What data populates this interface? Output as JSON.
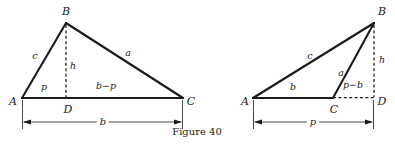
{
  "figure": {
    "caption": "Figure 40",
    "background_color": "#ffffff",
    "ink_color": "#1a1a1a",
    "solid_stroke_width": 2.1,
    "thin_stroke_width": 0.8,
    "dash_pattern": "3,2.4"
  },
  "diagrams": [
    {
      "id": "acute-triangle",
      "name": "acute triangle with interior altitude",
      "vertices": {
        "A": {
          "label": "A",
          "x": 22,
          "y": 98
        },
        "B": {
          "label": "B",
          "x": 66,
          "y": 23
        },
        "C": {
          "label": "C",
          "x": 183,
          "y": 98
        },
        "D": {
          "label": "D",
          "x": 66,
          "y": 98
        }
      },
      "vertex_labels": [
        {
          "text": "A",
          "x": 13,
          "y": 101
        },
        {
          "text": "B",
          "x": 66,
          "y": 11
        },
        {
          "text": "C",
          "x": 191,
          "y": 101
        },
        {
          "text": "D",
          "x": 68,
          "y": 109
        }
      ],
      "solid_edges": [
        {
          "name": "side-c",
          "from": "A",
          "to": "B"
        },
        {
          "name": "side-a",
          "from": "B",
          "to": "C"
        },
        {
          "name": "base-b",
          "from": "A",
          "to": "C"
        }
      ],
      "dashed_edges": [
        {
          "name": "altitude-h",
          "from": "B",
          "to": "D"
        }
      ],
      "side_labels": [
        {
          "name": "label-c",
          "text": "c",
          "x": 35,
          "y": 56
        },
        {
          "name": "label-a",
          "text": "a",
          "x": 128,
          "y": 53
        },
        {
          "name": "label-h",
          "text": "h",
          "x": 73,
          "y": 66
        },
        {
          "name": "label-p",
          "text": "p",
          "x": 44,
          "y": 87
        },
        {
          "name": "label-b-minus-p",
          "text": "b−p",
          "x": 106,
          "y": 86
        }
      ],
      "dimension": {
        "name": "overall-base-dimension",
        "label": "b",
        "label_x": 103,
        "label_y": 122,
        "y": 122,
        "x1": 22,
        "x2": 183,
        "tick_top": 100,
        "tick_bottom": 129
      }
    },
    {
      "id": "obtuse-triangle",
      "name": "obtuse triangle with exterior altitude",
      "vertices": {
        "A": {
          "label": "A",
          "x": 253,
          "y": 98
        },
        "B": {
          "label": "B",
          "x": 374,
          "y": 23
        },
        "C": {
          "label": "C",
          "x": 333,
          "y": 98
        },
        "D": {
          "label": "D",
          "x": 374,
          "y": 98
        }
      },
      "vertex_labels": [
        {
          "text": "A",
          "x": 245,
          "y": 101
        },
        {
          "text": "B",
          "x": 382,
          "y": 11
        },
        {
          "text": "C",
          "x": 334,
          "y": 109
        },
        {
          "text": "D",
          "x": 382,
          "y": 101
        }
      ],
      "solid_edges": [
        {
          "name": "side-c",
          "from": "A",
          "to": "B"
        },
        {
          "name": "side-a",
          "from": "C",
          "to": "B"
        },
        {
          "name": "base-b",
          "from": "A",
          "to": "C"
        }
      ],
      "dashed_edges": [
        {
          "name": "altitude-h",
          "from": "B",
          "to": "D"
        },
        {
          "name": "base-extension",
          "from": "C",
          "to": "D"
        }
      ],
      "side_labels": [
        {
          "name": "label-c",
          "text": "c",
          "x": 310,
          "y": 56
        },
        {
          "name": "label-a",
          "text": "a",
          "x": 341,
          "y": 73
        },
        {
          "name": "label-h",
          "text": "h",
          "x": 382,
          "y": 60
        },
        {
          "name": "label-b",
          "text": "b",
          "x": 293,
          "y": 87
        },
        {
          "name": "label-p-minus-b",
          "text": "p−b",
          "x": 353,
          "y": 85
        }
      ],
      "dimension": {
        "name": "overall-base-dimension",
        "label": "p",
        "label_x": 313,
        "label_y": 122,
        "y": 122,
        "x1": 253,
        "x2": 374,
        "tick_top": 100,
        "tick_bottom": 129
      }
    }
  ]
}
